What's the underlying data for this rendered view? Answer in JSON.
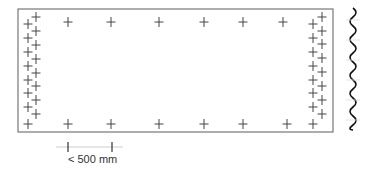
{
  "diagram": {
    "colors": {
      "outline": "#777777",
      "cross": "#444444",
      "wave": "#111111",
      "scale_line": "#cccccc",
      "scale_tick": "#333333",
      "text": "#333333"
    },
    "panel": {
      "x": 18,
      "y": 9,
      "width": 315,
      "height": 123
    },
    "crosses": {
      "top_row": [
        [
          68,
          22
        ],
        [
          111,
          22
        ],
        [
          159,
          22
        ],
        [
          204,
          22
        ],
        [
          243,
          22
        ],
        [
          283,
          22
        ]
      ],
      "bottom_row": [
        [
          68,
          124
        ],
        [
          111,
          124
        ],
        [
          159,
          124
        ],
        [
          204,
          124
        ],
        [
          243,
          124
        ],
        [
          287,
          124
        ]
      ],
      "left_outer": [
        [
          36,
          17
        ],
        [
          36,
          31
        ],
        [
          36,
          45
        ],
        [
          36,
          59
        ],
        [
          36,
          73
        ],
        [
          36,
          86
        ],
        [
          36,
          100
        ],
        [
          36,
          114
        ]
      ],
      "left_inner": [
        [
          28,
          24
        ],
        [
          28,
          38
        ],
        [
          28,
          52
        ],
        [
          28,
          66
        ],
        [
          28,
          80
        ],
        [
          28,
          93
        ],
        [
          28,
          107
        ],
        [
          28,
          124
        ]
      ],
      "right_outer": [
        [
          322,
          17
        ],
        [
          322,
          31
        ],
        [
          322,
          44
        ],
        [
          322,
          58
        ],
        [
          322,
          72
        ],
        [
          322,
          86
        ],
        [
          322,
          100
        ],
        [
          322,
          114
        ]
      ],
      "right_inner": [
        [
          313,
          24
        ],
        [
          313,
          38
        ],
        [
          313,
          52
        ],
        [
          313,
          66
        ],
        [
          313,
          80
        ],
        [
          313,
          93
        ],
        [
          313,
          107
        ],
        [
          313,
          124
        ]
      ]
    },
    "break_line": {
      "x": 353,
      "y_start": 8,
      "y_end": 130,
      "amplitude": 3,
      "period": 18
    },
    "scale_bar": {
      "line_x1": 56,
      "line_x2": 123,
      "y": 147,
      "tick_left_x": 68,
      "tick_right_x": 112,
      "label": "< 500 mm"
    }
  }
}
